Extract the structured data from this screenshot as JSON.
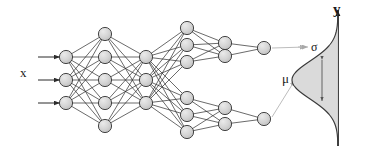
{
  "figure": {
    "type": "neural-network-diagram",
    "title": ""
  },
  "labels": {
    "input": "x",
    "output_axis": "y",
    "sigma": "σ",
    "mu": "μ"
  },
  "colors": {
    "node_fill": "#d2d2d2",
    "node_stroke": "#333333",
    "edge": "#2b2b2b",
    "annotation_line": "#bdbdbd",
    "curve_stroke": "#3a3a3a",
    "curve_fill": "#d8d8d8",
    "axis": "#111111",
    "background": "#ffffff",
    "text": "#1a1a1a"
  },
  "geometry": {
    "width": 366,
    "height": 149,
    "node_radius": 6.6,
    "edge_width": 0.7
  },
  "network": {
    "input_arrows": {
      "count": 3,
      "x_start": 38,
      "x_end": 60,
      "ys": [
        57,
        80,
        103
      ]
    },
    "layers": [
      {
        "name": "input-layer",
        "count": 3,
        "x": 66,
        "ys": [
          57,
          80,
          103
        ]
      },
      {
        "name": "hidden-layer-1",
        "count": 5,
        "x": 105,
        "ys": [
          34,
          57,
          80,
          103,
          126
        ]
      },
      {
        "name": "bottleneck-layer",
        "count": 3,
        "x": 146,
        "ys": [
          57,
          80,
          103
        ]
      },
      {
        "name": "branch-top-layer-1",
        "count": 3,
        "x": 187,
        "ys": [
          28,
          45,
          62
        ]
      },
      {
        "name": "branch-top-layer-2",
        "count": 2,
        "x": 225,
        "ys": [
          43,
          56
        ]
      },
      {
        "name": "branch-top-output",
        "count": 1,
        "x": 264,
        "ys": [
          48
        ]
      },
      {
        "name": "branch-bottom-layer-1",
        "count": 3,
        "x": 187,
        "ys": [
          98,
          115,
          132
        ]
      },
      {
        "name": "branch-bottom-layer-2",
        "count": 2,
        "x": 225,
        "ys": [
          108,
          124
        ]
      },
      {
        "name": "branch-bottom-output",
        "count": 1,
        "x": 264,
        "ys": [
          119
        ]
      }
    ],
    "connections": [
      {
        "from": "input-layer",
        "to": "hidden-layer-1"
      },
      {
        "from": "hidden-layer-1",
        "to": "bottleneck-layer"
      },
      {
        "from": "bottleneck-layer",
        "to": "branch-top-layer-1"
      },
      {
        "from": "bottleneck-layer",
        "to": "branch-bottom-layer-1"
      },
      {
        "from": "branch-top-layer-1",
        "to": "branch-top-layer-2"
      },
      {
        "from": "branch-top-layer-2",
        "to": "branch-top-output"
      },
      {
        "from": "branch-bottom-layer-1",
        "to": "branch-bottom-layer-2"
      },
      {
        "from": "branch-bottom-layer-2",
        "to": "branch-bottom-output"
      }
    ],
    "annotations": [
      {
        "name": "sigma-connector",
        "label": "σ",
        "from_x": 272,
        "from_y": 48,
        "to_x": 306,
        "to_y": 47
      },
      {
        "name": "mu-connector",
        "label": "μ",
        "from_x": 272,
        "from_y": 117,
        "to_x": 295,
        "to_y": 80
      }
    ]
  },
  "distribution": {
    "type": "gaussian",
    "orientation": "horizontal-density-vertical-axis",
    "axis_x": 338,
    "axis_y_top": 10,
    "axis_y_bottom": 146,
    "mean_y": 80,
    "sigma_px": 19,
    "peak_width_px": 46,
    "sigma_marker": {
      "x": 322,
      "y_top": 60,
      "y_bottom": 101,
      "double_headed": true
    }
  }
}
